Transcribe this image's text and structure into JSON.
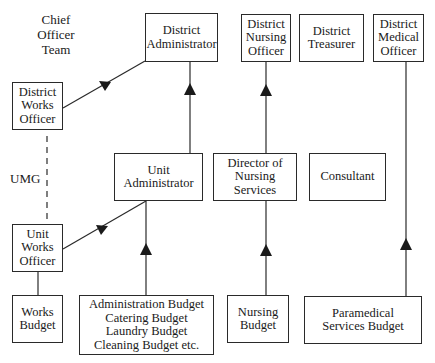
{
  "title_label": "Chief\nOfficer\nTeam",
  "umg_label": "UMG",
  "boxes": {
    "district_administrator": "District\nAdministrator",
    "district_nursing_officer": "District\nNursing\nOfficer",
    "district_treasurer": "District\nTreasurer",
    "district_medical_officer": "District\nMedical\nOfficer",
    "district_works_officer": "District\nWorks\nOfficer",
    "unit_administrator": "Unit\nAdministrator",
    "director_of_nursing_services": "Director of\nNursing\nServices",
    "consultant": "Consultant",
    "unit_works_officer": "Unit\nWorks\nOfficer",
    "works_budget": "Works\nBudget",
    "admin_budgets": "Administration Budget\nCatering Budget\nLaundry Budget\nCleaning Budget etc.",
    "nursing_budget": "Nursing\nBudget",
    "paramedical_budget": "Paramedical\nServices Budget"
  },
  "colors": {
    "line": "#2a2a2a",
    "background": "#ffffff"
  }
}
